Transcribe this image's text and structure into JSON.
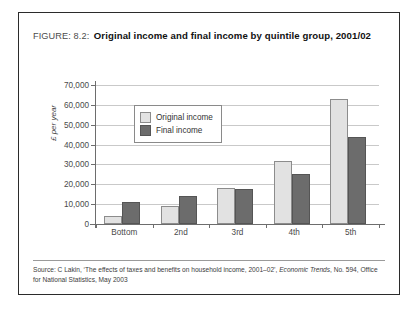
{
  "figure": {
    "label": "FIGURE: 8.2:",
    "title": "Original income and final income by quintile group, 2001/02",
    "source": "Source: C Lakin, ‘The effects of taxes and benefits on household income, 2001–02’, ",
    "source_italic": "Economic Trends",
    "source_tail": ", No. 594, Office for National Statistics, May 2003"
  },
  "chart_data": {
    "type": "bar",
    "title": "Original income and final income by quintile group, 2001/02",
    "categories": [
      "Bottom",
      "2nd",
      "3rd",
      "4th",
      "5th"
    ],
    "series": [
      {
        "name": "Original income",
        "color": "#e2e2e2",
        "values": [
          4000,
          9000,
          18000,
          31500,
          63000
        ]
      },
      {
        "name": "Final income",
        "color": "#6c6c6c",
        "values": [
          11000,
          14000,
          17500,
          25000,
          44000
        ]
      }
    ],
    "xlabel": "",
    "ylabel": "£ per year",
    "ylim": [
      0,
      70000
    ],
    "ytick_values": [
      0,
      10000,
      20000,
      30000,
      40000,
      50000,
      60000,
      70000
    ],
    "ytick_labels": [
      "0",
      "10,000",
      "20,000",
      "30,000",
      "40,000",
      "50,000",
      "60,000",
      "70,000"
    ],
    "grid": true,
    "legend_position": "upper-left-inset"
  }
}
